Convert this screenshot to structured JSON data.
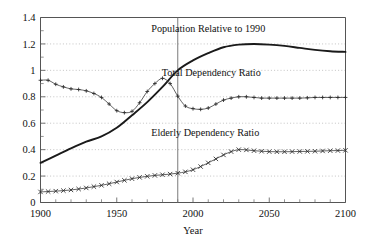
{
  "chart_data": {
    "type": "line",
    "title": "",
    "xlabel": "Year",
    "ylabel": "",
    "xlim": [
      1900,
      2100
    ],
    "ylim": [
      0,
      1.4
    ],
    "grid": true,
    "legend_position": "inline-annotations",
    "x_major_ticks": [
      1900,
      1950,
      2000,
      2050,
      2100
    ],
    "x_tick_labels": [
      "1900",
      "1950",
      "2000",
      "2050",
      "2100"
    ],
    "x_minor_tick_step": 10,
    "y_major_ticks": [
      0,
      0.2,
      0.4,
      0.6,
      0.8,
      1,
      1.2,
      1.4
    ],
    "y_tick_labels": [
      "0",
      "0.2",
      "0.4",
      "0.6",
      "0.8",
      "1",
      "1.2",
      "1.4"
    ],
    "y_minor_tick_step": 0.1,
    "reference_line": {
      "x": 1990,
      "label": ""
    },
    "annotations": [
      {
        "id": "pop",
        "text": "Population Relative to 1990",
        "x": 2010,
        "y": 1.29
      },
      {
        "id": "tdr",
        "text": "Total Dependency Ratio",
        "x": 2012,
        "y": 0.955
      },
      {
        "id": "edr",
        "text": "Elderly Dependency Ratio",
        "x": 2008,
        "y": 0.5
      }
    ],
    "series": [
      {
        "name": "Population Relative to 1990",
        "marker": "none",
        "style": "thick-solid",
        "x": [
          1900,
          1910,
          1920,
          1930,
          1940,
          1950,
          1960,
          1970,
          1980,
          1990,
          2000,
          2010,
          2020,
          2030,
          2040,
          2050,
          2060,
          2070,
          2080,
          2090,
          2100
        ],
        "values": [
          0.3,
          0.355,
          0.41,
          0.46,
          0.5,
          0.565,
          0.66,
          0.76,
          0.875,
          1.0,
          1.075,
          1.13,
          1.175,
          1.195,
          1.2,
          1.195,
          1.185,
          1.17,
          1.155,
          1.145,
          1.14
        ]
      },
      {
        "name": "Total Dependency Ratio",
        "marker": "plus",
        "style": "thin-solid",
        "x": [
          1900,
          1905,
          1910,
          1915,
          1920,
          1925,
          1930,
          1935,
          1940,
          1945,
          1950,
          1955,
          1960,
          1965,
          1970,
          1975,
          1980,
          1985,
          1990,
          1995,
          2000,
          2005,
          2010,
          2015,
          2020,
          2025,
          2030,
          2035,
          2040,
          2045,
          2050,
          2055,
          2060,
          2065,
          2070,
          2075,
          2080,
          2085,
          2090,
          2095,
          2100
        ],
        "values": [
          0.925,
          0.925,
          0.895,
          0.875,
          0.86,
          0.855,
          0.845,
          0.825,
          0.795,
          0.745,
          0.695,
          0.68,
          0.69,
          0.755,
          0.84,
          0.9,
          0.94,
          0.9,
          0.805,
          0.73,
          0.71,
          0.705,
          0.715,
          0.745,
          0.775,
          0.79,
          0.8,
          0.8,
          0.795,
          0.79,
          0.79,
          0.79,
          0.79,
          0.79,
          0.79,
          0.792,
          0.795,
          0.795,
          0.795,
          0.795,
          0.795
        ]
      },
      {
        "name": "Elderly Dependency Ratio",
        "marker": "cross",
        "style": "thin-solid",
        "x": [
          1900,
          1905,
          1910,
          1915,
          1920,
          1925,
          1930,
          1935,
          1940,
          1945,
          1950,
          1955,
          1960,
          1965,
          1970,
          1975,
          1980,
          1985,
          1990,
          1995,
          2000,
          2005,
          2010,
          2015,
          2020,
          2025,
          2030,
          2035,
          2040,
          2045,
          2050,
          2055,
          2060,
          2065,
          2070,
          2075,
          2080,
          2085,
          2090,
          2095,
          2100
        ],
        "values": [
          0.08,
          0.083,
          0.086,
          0.09,
          0.095,
          0.102,
          0.11,
          0.12,
          0.13,
          0.142,
          0.155,
          0.168,
          0.18,
          0.19,
          0.198,
          0.205,
          0.21,
          0.215,
          0.222,
          0.232,
          0.248,
          0.272,
          0.3,
          0.33,
          0.36,
          0.385,
          0.4,
          0.398,
          0.392,
          0.388,
          0.385,
          0.384,
          0.384,
          0.385,
          0.386,
          0.387,
          0.388,
          0.39,
          0.392,
          0.393,
          0.395
        ]
      }
    ]
  }
}
